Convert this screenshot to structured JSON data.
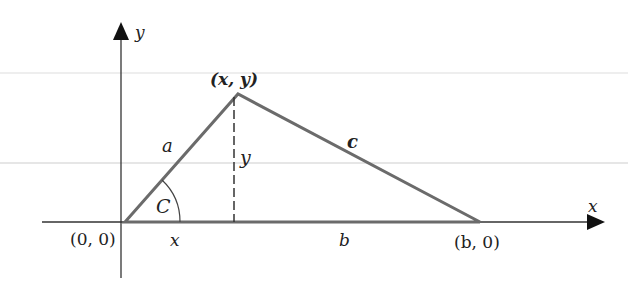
{
  "figure": {
    "axes": {
      "x_label": "x",
      "y_label": "y"
    },
    "vertices": {
      "origin": "(0, 0)",
      "apex": "(x, y)",
      "base_right": "(b, 0)"
    },
    "sides": {
      "a": "a",
      "b": "b",
      "c": "c"
    },
    "angle_label": "C",
    "height_label": "y",
    "foot_label": "x",
    "colors": {
      "triangle": "#6b6b6b",
      "axes": "#333333",
      "text": "#222222",
      "artifact_lines": "#e6e6e6"
    }
  }
}
